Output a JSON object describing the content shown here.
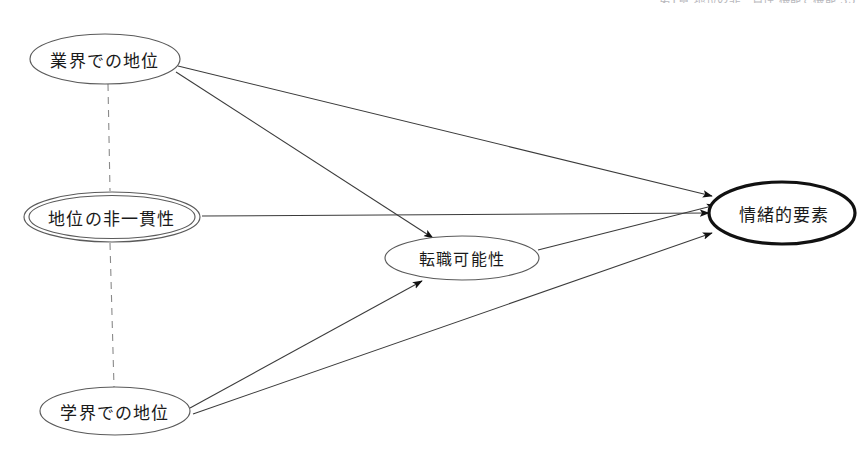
{
  "page": {
    "header_fragment": "第1章   地位の非一貫性   機能と機能   35",
    "width": 864,
    "height": 449,
    "background_color": "#ffffff",
    "stroke_color": "#3b3b3b",
    "text_color": "#1a1a1a"
  },
  "diagram": {
    "type": "path-diagram",
    "nodes": [
      {
        "id": "industry_status",
        "label": "業界での地位",
        "shape": "ellipse",
        "emphasis": "normal",
        "cx": 105,
        "cy": 59,
        "rx": 75,
        "ry": 25
      },
      {
        "id": "status_inconsistency",
        "label": "地位の非一貫性",
        "shape": "double-ellipse",
        "emphasis": "double",
        "cx": 112,
        "cy": 217,
        "rx": 88,
        "ry": 25
      },
      {
        "id": "academic_status",
        "label": "学界での地位",
        "shape": "ellipse",
        "emphasis": "normal",
        "cx": 115,
        "cy": 411,
        "rx": 75,
        "ry": 24
      },
      {
        "id": "job_mobility",
        "label": "転職可能性",
        "shape": "ellipse",
        "emphasis": "normal",
        "cx": 462,
        "cy": 258,
        "rx": 77,
        "ry": 22
      },
      {
        "id": "emotional_factor",
        "label": "情緒的要素",
        "shape": "ellipse",
        "emphasis": "bold",
        "cx": 782,
        "cy": 213,
        "rx": 73,
        "ry": 31
      }
    ],
    "edges": [
      {
        "id": "e1",
        "from": "industry_status",
        "to": "emotional_factor",
        "style": "solid",
        "arrow": true
      },
      {
        "id": "e2",
        "from": "industry_status",
        "to": "job_mobility",
        "style": "solid",
        "arrow": true
      },
      {
        "id": "e3",
        "from": "status_inconsistency",
        "to": "emotional_factor",
        "style": "solid",
        "arrow": true
      },
      {
        "id": "e4",
        "from": "academic_status",
        "to": "job_mobility",
        "style": "solid",
        "arrow": true
      },
      {
        "id": "e5",
        "from": "academic_status",
        "to": "emotional_factor",
        "style": "solid",
        "arrow": true
      },
      {
        "id": "e6",
        "from": "job_mobility",
        "to": "emotional_factor",
        "style": "solid",
        "arrow": true
      },
      {
        "id": "d1",
        "from": "industry_status",
        "to": "status_inconsistency",
        "style": "dashed",
        "arrow": false
      },
      {
        "id": "d2",
        "from": "status_inconsistency",
        "to": "academic_status",
        "style": "dashed",
        "arrow": false
      }
    ]
  }
}
